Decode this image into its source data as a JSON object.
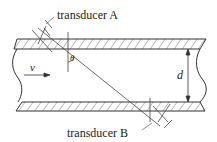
{
  "diagram": {
    "labels": {
      "transducer_a": "transducer A",
      "transducer_b": "transducer B",
      "velocity": "v",
      "angle": "θ",
      "diameter": "d"
    },
    "colors": {
      "line": "#333333",
      "background": "#ffffff"
    }
  }
}
